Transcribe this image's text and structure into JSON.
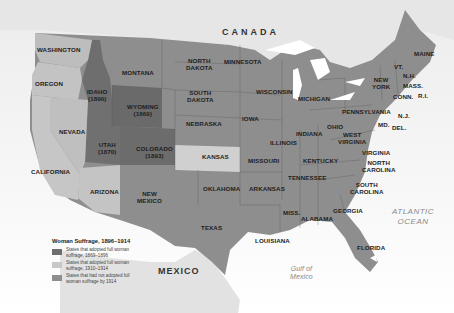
{
  "map": {
    "title": "Woman Suffrage, 1896–1914",
    "colors": {
      "adopted_1869_1896": "#6e6e6e",
      "adopted_1910_1914": "#c8c8c8",
      "not_adopted": "#8e8e8e",
      "foreign_land": "#e2e2e2",
      "water": "#ffffff"
    },
    "regions": {
      "canada": "CANADA",
      "mexico": "MEXICO",
      "gulf": "Gulf of Mexico",
      "gulf_line1": "Gulf of",
      "gulf_line2": "Mexico",
      "atlantic_line1": "ATLANTIC",
      "atlantic_line2": "OCEAN"
    },
    "states": [
      {
        "name": "WASHINGTON"
      },
      {
        "name": "OREGON"
      },
      {
        "name": "CALIFORNIA"
      },
      {
        "name": "NEVADA"
      },
      {
        "name": "IDAHO",
        "year": "(1896)"
      },
      {
        "name": "MONTANA"
      },
      {
        "name": "WYOMING",
        "year": "(1869)"
      },
      {
        "name": "UTAH",
        "year": "(1870)"
      },
      {
        "name": "COLORADO",
        "year": "(1893)"
      },
      {
        "name": "ARIZONA"
      },
      {
        "name": "NEW",
        "name2": "MEXICO"
      },
      {
        "name": "NORTH",
        "name2": "DAKOTA"
      },
      {
        "name": "SOUTH",
        "name2": "DAKOTA"
      },
      {
        "name": "NEBRASKA"
      },
      {
        "name": "KANSAS"
      },
      {
        "name": "OKLAHOMA"
      },
      {
        "name": "TEXAS"
      },
      {
        "name": "MINNESOTA"
      },
      {
        "name": "IOWA"
      },
      {
        "name": "MISSOURI"
      },
      {
        "name": "ARKANSAS"
      },
      {
        "name": "LOUISIANA"
      },
      {
        "name": "WISCONSIN"
      },
      {
        "name": "ILLINOIS"
      },
      {
        "name": "MICHIGAN"
      },
      {
        "name": "INDIANA"
      },
      {
        "name": "OHIO"
      },
      {
        "name": "KENTUCKY"
      },
      {
        "name": "TENNESSEE"
      },
      {
        "name": "MISS."
      },
      {
        "name": "ALABAMA"
      },
      {
        "name": "GEORGIA"
      },
      {
        "name": "FLORIDA"
      },
      {
        "name": "SOUTH",
        "name2": "CAROLINA"
      },
      {
        "name": "NORTH",
        "name2": "CAROLINA"
      },
      {
        "name": "VIRGINIA"
      },
      {
        "name": "WEST",
        "name2": "VIRGINIA"
      },
      {
        "name": "PENNSYLVANIA"
      },
      {
        "name": "NEW",
        "name2": "YORK"
      },
      {
        "name": "VT."
      },
      {
        "name": "N.H."
      },
      {
        "name": "MAINE"
      },
      {
        "name": "MASS."
      },
      {
        "name": "CONN."
      },
      {
        "name": "R.I."
      },
      {
        "name": "N.J."
      },
      {
        "name": "MD."
      },
      {
        "name": "DEL."
      }
    ],
    "legend": {
      "title": "Woman Suffrage, 1896–1914",
      "items": [
        {
          "label": "States that adopted full woman suffrage, 1869–1896",
          "color": "#6e6e6e"
        },
        {
          "label": "States that adopted full woman suffrage, 1910–1914",
          "color": "#c8c8c8"
        },
        {
          "label": "States that had not adopted full woman suffrage by 1914",
          "color": "#8e8e8e"
        }
      ]
    }
  }
}
